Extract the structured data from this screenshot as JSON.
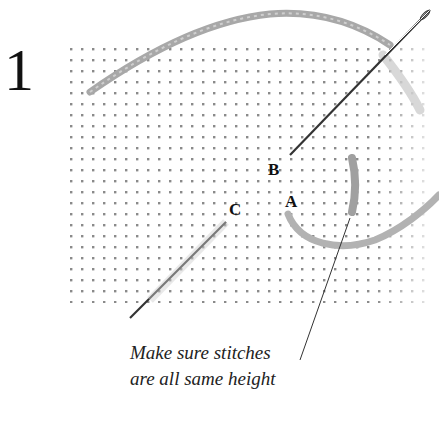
{
  "step": {
    "number": "1"
  },
  "labels": {
    "a": "A",
    "b": "B",
    "c": "C"
  },
  "caption": {
    "line1": "Make sure stitches",
    "line2": "are all same height"
  },
  "colors": {
    "canvas_dot": "#8a8a8a",
    "thread": "#a8a8a8",
    "needle": "#333333",
    "text": "#111111"
  },
  "icons": {
    "needle": "needle-icon",
    "thread": "thread-icon",
    "canvas": "canvas-mesh"
  }
}
